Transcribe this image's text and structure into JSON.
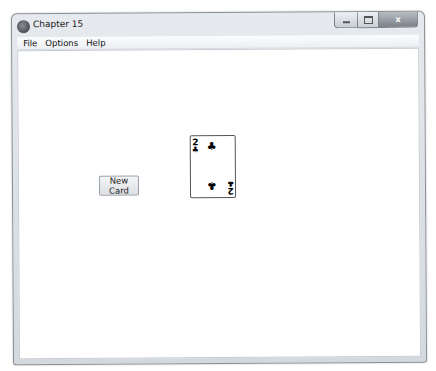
{
  "window": {
    "title": "Chapter 15",
    "app_icon": "app-icon",
    "caption_buttons": {
      "minimize": "minimize-icon",
      "maximize": "maximize-icon",
      "close_glyph": "x"
    }
  },
  "menubar": {
    "items": [
      {
        "label": "File"
      },
      {
        "label": "Options"
      },
      {
        "label": "Help"
      }
    ]
  },
  "client": {
    "new_card_button": {
      "label": "New Card"
    },
    "card": {
      "rank": "2",
      "suit": "clubs",
      "suit_glyph": "♣",
      "color": "#000000"
    }
  }
}
